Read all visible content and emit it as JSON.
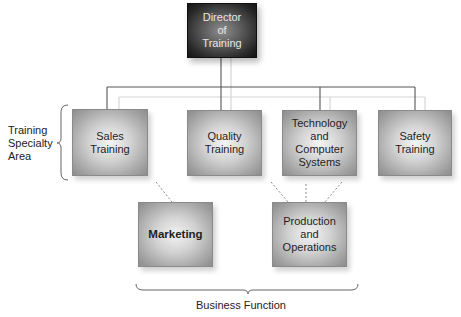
{
  "diagram": {
    "type": "org-chart",
    "root": {
      "id": "director",
      "label": "Director\nof\nTraining"
    },
    "specialty_areas": [
      {
        "id": "sales",
        "label": "Sales\nTraining"
      },
      {
        "id": "quality",
        "label": "Quality\nTraining"
      },
      {
        "id": "technology",
        "label": "Technology\nand\nComputer\nSystems"
      },
      {
        "id": "safety",
        "label": "Safety\nTraining"
      }
    ],
    "business_functions": [
      {
        "id": "marketing",
        "label": "Marketing"
      },
      {
        "id": "production",
        "label": "Production\nand\nOperations"
      }
    ],
    "group_labels": {
      "specialty": "Training\nSpecialty\nArea",
      "business": "Business Function"
    },
    "edges": [
      {
        "from": "director",
        "to": "sales",
        "style": "solid"
      },
      {
        "from": "director",
        "to": "quality",
        "style": "solid"
      },
      {
        "from": "director",
        "to": "technology",
        "style": "solid"
      },
      {
        "from": "director",
        "to": "safety",
        "style": "solid"
      },
      {
        "from": "sales",
        "to": "marketing",
        "style": "dashed"
      },
      {
        "from": "quality",
        "to": "production",
        "style": "dashed"
      },
      {
        "from": "technology",
        "to": "production",
        "style": "dashed"
      },
      {
        "from": "safety",
        "to": "production",
        "style": "dashed"
      }
    ],
    "colors": {
      "root_fill_dark": "#141414",
      "node_fill_edge": "#8c8c8c",
      "node_fill_center": "#f4f4f4",
      "connector": "#555555",
      "connector_light": "#d4d4d4",
      "dashed": "#8a8a8a"
    }
  }
}
